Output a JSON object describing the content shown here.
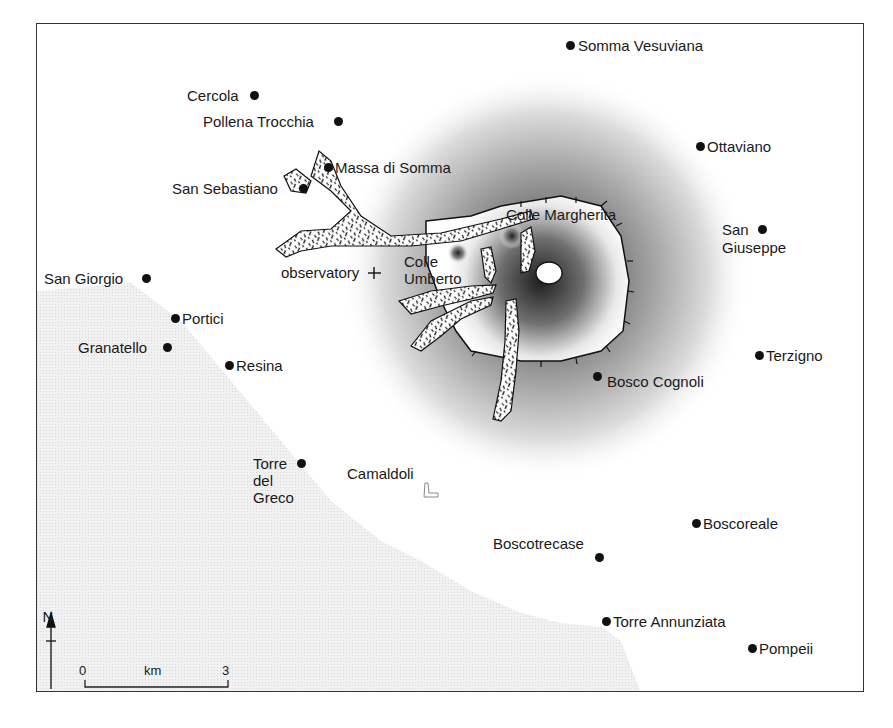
{
  "map": {
    "title_caption": "",
    "colors": {
      "sea": "#ebebeb",
      "ink": "#1a1a1a",
      "volcano_shade_dark": "#2a2a2a",
      "frame": "#333333"
    },
    "towns": [
      {
        "name": "Somma Vesuviana",
        "x": 569,
        "y": 45,
        "label_side": "right"
      },
      {
        "name": "Cercola",
        "x": 255,
        "y": 95,
        "label_side": "left"
      },
      {
        "name": "Pollena Trocchia",
        "x": 338,
        "y": 121,
        "label_side": "left"
      },
      {
        "name": "Ottaviano",
        "x": 699,
        "y": 146,
        "label_side": "right"
      },
      {
        "name": "Massa di Somma",
        "x": 328,
        "y": 167,
        "label_side": "right"
      },
      {
        "name": "San Sebastiano",
        "x": 303,
        "y": 188,
        "label_side": "left"
      },
      {
        "name": "San Giuseppe",
        "x": 762,
        "y": 229,
        "label_side": "left-two-line"
      },
      {
        "name": "San Giorgio",
        "x": 146,
        "y": 278,
        "label_side": "left"
      },
      {
        "name": "Portici",
        "x": 175,
        "y": 318,
        "label_side": "right"
      },
      {
        "name": "Granatello",
        "x": 167,
        "y": 347,
        "label_side": "left"
      },
      {
        "name": "Resina",
        "x": 229,
        "y": 365,
        "label_side": "right"
      },
      {
        "name": "Terzigno",
        "x": 759,
        "y": 355,
        "label_side": "right"
      },
      {
        "name": "Bosco Cognoli",
        "x": 597,
        "y": 376,
        "label_side": "right"
      },
      {
        "name": "Torre del Greco",
        "x": 301,
        "y": 463,
        "label_side": "left-three-line"
      },
      {
        "name": "Boscoreale",
        "x": 696,
        "y": 523,
        "label_side": "right"
      },
      {
        "name": "Boscotrecase",
        "x": 599,
        "y": 557,
        "label_side": "above"
      },
      {
        "name": "Torre Annunziata",
        "x": 606,
        "y": 621,
        "label_side": "right"
      },
      {
        "name": "Pompeii",
        "x": 752,
        "y": 648,
        "label_side": "right"
      }
    ],
    "features": {
      "observatory": {
        "label": "observatory",
        "symbol": "+",
        "x": 373,
        "y": 272
      },
      "colle_margherita": {
        "label": "Colle Margherita"
      },
      "colle_umberto": {
        "label_line1": "Colle",
        "label_line2": "Umberto"
      },
      "camaldoli": {
        "label": "Camaldoli"
      }
    },
    "north_arrow": {
      "label": "N"
    },
    "scale_bar": {
      "start": "0",
      "unit": "km",
      "end": "3"
    }
  }
}
